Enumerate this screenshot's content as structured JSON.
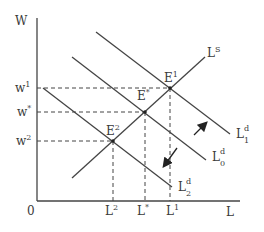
{
  "diagram": {
    "axes": {
      "y_label": "W",
      "x_label": "L",
      "origin_label": "0"
    },
    "wage_ticks": [
      {
        "id": "w1",
        "base": "w",
        "sup": "1"
      },
      {
        "id": "wstar",
        "base": "w",
        "sup": "*"
      },
      {
        "id": "w2",
        "base": "w",
        "sup": "2"
      }
    ],
    "quantity_ticks": [
      {
        "id": "L2",
        "base": "L",
        "sup": "2"
      },
      {
        "id": "Lstar",
        "base": "L",
        "sup": "*"
      },
      {
        "id": "L1",
        "base": "L",
        "sup": "1"
      }
    ],
    "curves": {
      "supply": {
        "base": "L",
        "sup": "S"
      },
      "demand_1": {
        "base": "L",
        "sup": "d",
        "sub": "1"
      },
      "demand_0": {
        "base": "L",
        "sup": "d",
        "sub": "0"
      },
      "demand_2": {
        "base": "L",
        "sup": "d",
        "sub": "2"
      }
    },
    "equilibria": [
      {
        "id": "E1",
        "base": "E",
        "sup": "1"
      },
      {
        "id": "Estar",
        "base": "E",
        "sup": "*"
      },
      {
        "id": "E2",
        "base": "E",
        "sup": "2"
      }
    ],
    "arrows": [
      {
        "id": "shift-up",
        "direction": "up-right"
      },
      {
        "id": "shift-down",
        "direction": "down-left"
      }
    ],
    "colors": {
      "line": "#3a3a3a",
      "background": "#ffffff"
    }
  }
}
